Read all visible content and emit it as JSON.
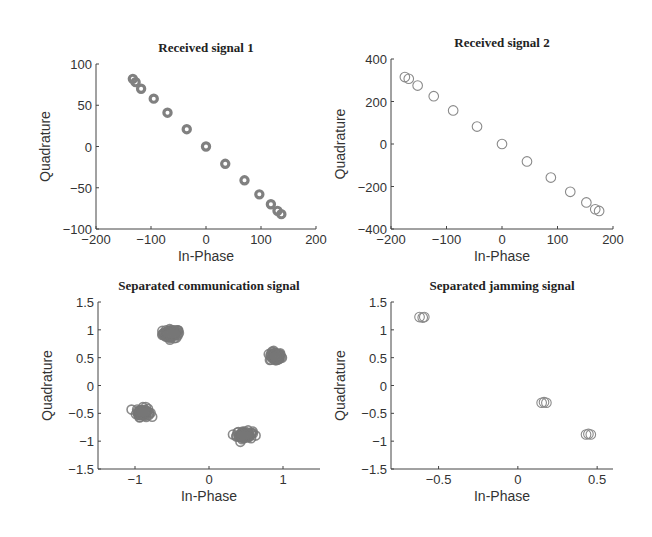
{
  "chart_data": [
    {
      "id": "received-signal-1",
      "type": "scatter",
      "title": "Received signal 1",
      "xlabel": "In-Phase",
      "ylabel": "Quadrature",
      "xlim": [
        -200,
        200
      ],
      "ylim": [
        -100,
        100
      ],
      "xticks": [
        -200,
        -100,
        0,
        100,
        200
      ],
      "yticks": [
        -100,
        -50,
        0,
        50,
        100
      ],
      "grid": false,
      "marker": "o",
      "marker_style": "thick-ring",
      "color": "#808080",
      "box_px": {
        "left": 96,
        "top": 64,
        "right": 316,
        "bottom": 229
      },
      "x": [
        -133,
        -128,
        -118,
        -95,
        -70,
        -35,
        0,
        35,
        70,
        97,
        118,
        130,
        137
      ],
      "y": [
        82,
        78,
        70,
        58,
        41,
        21,
        0,
        -21,
        -41,
        -58,
        -70,
        -78,
        -82
      ]
    },
    {
      "id": "received-signal-2",
      "type": "scatter",
      "title": "Received signal 2",
      "xlabel": "In-Phase",
      "ylabel": "Quadrature",
      "xlim": [
        -200,
        200
      ],
      "ylim": [
        -400,
        400
      ],
      "xticks": [
        -200,
        -100,
        0,
        100,
        200
      ],
      "yticks": [
        -400,
        -200,
        0,
        200,
        400
      ],
      "grid": false,
      "marker": "o",
      "marker_style": "thin-ring",
      "color": "#8a8a8a",
      "box_px": {
        "left": 391,
        "top": 59,
        "right": 613,
        "bottom": 229
      },
      "x": [
        -175,
        -168,
        -152,
        -123,
        -88,
        -45,
        0,
        45,
        88,
        123,
        152,
        168,
        175
      ],
      "y": [
        315,
        307,
        275,
        225,
        158,
        82,
        0,
        -82,
        -158,
        -225,
        -275,
        -307,
        -315
      ]
    },
    {
      "id": "separated-communication-signal",
      "type": "scatter",
      "title": "Separated communication signal",
      "xlabel": "In-Phase",
      "ylabel": "Quadrature",
      "xlim": [
        -1.5,
        1.5
      ],
      "ylim": [
        -1.5,
        1.5
      ],
      "xticks": [
        -1,
        0,
        1
      ],
      "yticks": [
        -1.5,
        -1,
        -0.5,
        0,
        0.5,
        1,
        1.5
      ],
      "grid": false,
      "marker": "o",
      "marker_style": "dense-cluster",
      "color": "#777777",
      "box_px": {
        "left": 98,
        "top": 302,
        "right": 320,
        "bottom": 469
      },
      "clusters": [
        {
          "x": -0.51,
          "y": 0.93,
          "spread_x": 0.13,
          "spread_y": 0.09
        },
        {
          "x": 0.9,
          "y": 0.52,
          "spread_x": 0.09,
          "spread_y": 0.09
        },
        {
          "x": -0.89,
          "y": -0.48,
          "spread_x": 0.1,
          "spread_y": 0.09
        },
        {
          "x": 0.48,
          "y": -0.89,
          "spread_x": 0.12,
          "spread_y": 0.08
        }
      ]
    },
    {
      "id": "separated-jamming-signal",
      "type": "scatter",
      "title": "Separated jamming signal",
      "xlabel": "In-Phase",
      "ylabel": "Quadrature",
      "xlim": [
        -0.8,
        0.6
      ],
      "ylim": [
        -1.5,
        1.5
      ],
      "xticks": [
        -0.5,
        0,
        0.5
      ],
      "yticks": [
        -1.5,
        -1,
        -0.5,
        0,
        0.5,
        1,
        1.5
      ],
      "grid": false,
      "marker": "o",
      "marker_style": "thin-ring",
      "color": "#8a8a8a",
      "box_px": {
        "left": 391,
        "top": 302,
        "right": 613,
        "bottom": 469
      },
      "x": [
        -0.62,
        -0.6,
        -0.59,
        0.15,
        0.165,
        0.18,
        0.43,
        0.445,
        0.46
      ],
      "y": [
        1.23,
        1.22,
        1.23,
        -0.31,
        -0.3,
        -0.31,
        -0.88,
        -0.87,
        -0.88
      ]
    }
  ]
}
